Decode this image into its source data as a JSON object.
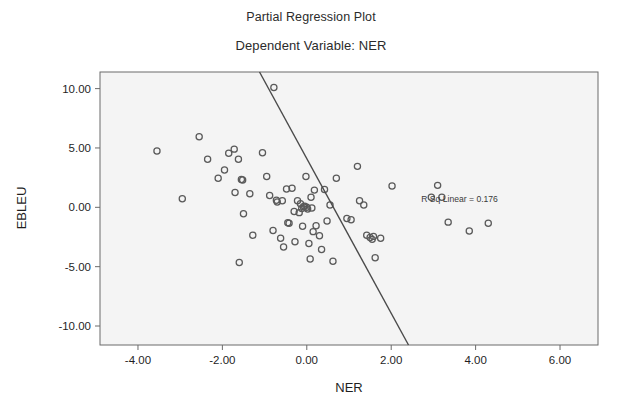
{
  "titles": {
    "main": "Partial Regression Plot",
    "sub": "Dependent Variable: NER"
  },
  "annotation": {
    "r_sq_label": "R Sq Linear = 0.176"
  },
  "axis_labels": {
    "x": "NER",
    "y": "EBLEU"
  },
  "ticks": {
    "x": [
      "-4.00",
      "-2.00",
      "0.00",
      "2.00",
      "4.00",
      "6.00"
    ],
    "y": [
      "10.00",
      "5.00",
      "0.00",
      "-5.00",
      "-10.00"
    ]
  },
  "colors": {
    "plot_background": "#f4f4f4",
    "frame": "#6b6b6b",
    "marker": "#5a5a5a",
    "fit_line": "#4a4a4a",
    "text": "#1f1f1f",
    "page_background": "#ffffff"
  },
  "chart_data": {
    "type": "scatter",
    "title": "Partial Regression Plot",
    "subtitle": "Dependent Variable: NER",
    "xlabel": "NER",
    "ylabel": "EBLEU",
    "xlim": [
      -4.9,
      6.9
    ],
    "ylim": [
      -11.6,
      11.4
    ],
    "xticks": [
      -4,
      -2,
      0,
      2,
      4,
      6
    ],
    "yticks": [
      10,
      5,
      0,
      -5,
      -10
    ],
    "grid": false,
    "legend": false,
    "annotations": [
      {
        "text": "R Sq Linear = 0.176",
        "x": 3.62,
        "y": 0.42
      }
    ],
    "r_squared": 0.176,
    "marker_style": "open-circle",
    "series": [
      {
        "name": "observations",
        "points": [
          [
            -3.55,
            4.75
          ],
          [
            -2.95,
            0.72
          ],
          [
            -2.55,
            5.95
          ],
          [
            -2.35,
            4.05
          ],
          [
            -2.1,
            2.45
          ],
          [
            -1.95,
            3.15
          ],
          [
            -1.85,
            4.55
          ],
          [
            -1.72,
            4.9
          ],
          [
            -1.7,
            1.25
          ],
          [
            -1.62,
            4.05
          ],
          [
            -1.6,
            -4.65
          ],
          [
            -1.55,
            2.35
          ],
          [
            -1.52,
            2.3
          ],
          [
            -1.5,
            -0.55
          ],
          [
            -1.35,
            1.15
          ],
          [
            -1.28,
            -2.35
          ],
          [
            -1.05,
            4.6
          ],
          [
            -0.95,
            2.6
          ],
          [
            -0.88,
            1.0
          ],
          [
            -0.8,
            -1.95
          ],
          [
            -0.78,
            10.1
          ],
          [
            -0.72,
            0.6
          ],
          [
            -0.7,
            0.45
          ],
          [
            -0.62,
            -2.6
          ],
          [
            -0.58,
            0.55
          ],
          [
            -0.55,
            -3.35
          ],
          [
            -0.48,
            1.55
          ],
          [
            -0.45,
            -1.3
          ],
          [
            -0.42,
            -1.35
          ],
          [
            -0.35,
            1.6
          ],
          [
            -0.3,
            -0.35
          ],
          [
            -0.28,
            -2.9
          ],
          [
            -0.22,
            0.55
          ],
          [
            -0.18,
            -0.45
          ],
          [
            -0.15,
            0.3
          ],
          [
            -0.12,
            -0.1
          ],
          [
            -0.1,
            -1.6
          ],
          [
            -0.08,
            0.05
          ],
          [
            -0.05,
            0.1
          ],
          [
            -0.02,
            2.6
          ],
          [
            0.0,
            0.0
          ],
          [
            0.02,
            -0.15
          ],
          [
            0.05,
            -3.05
          ],
          [
            0.08,
            -4.35
          ],
          [
            0.1,
            0.85
          ],
          [
            0.12,
            -0.05
          ],
          [
            0.15,
            -2.05
          ],
          [
            0.18,
            1.45
          ],
          [
            0.22,
            -1.55
          ],
          [
            0.3,
            -2.4
          ],
          [
            0.35,
            -3.55
          ],
          [
            0.42,
            1.5
          ],
          [
            0.48,
            -1.15
          ],
          [
            0.55,
            0.2
          ],
          [
            0.62,
            -4.55
          ],
          [
            0.7,
            2.45
          ],
          [
            0.95,
            -0.95
          ],
          [
            1.05,
            -1.05
          ],
          [
            1.2,
            3.45
          ],
          [
            1.25,
            0.55
          ],
          [
            1.35,
            0.2
          ],
          [
            1.42,
            -2.35
          ],
          [
            1.5,
            -2.55
          ],
          [
            1.55,
            -2.7
          ],
          [
            1.58,
            -2.45
          ],
          [
            1.62,
            -4.25
          ],
          [
            1.75,
            -2.6
          ],
          [
            2.02,
            1.8
          ],
          [
            2.95,
            0.85
          ],
          [
            3.1,
            1.85
          ],
          [
            3.2,
            0.85
          ],
          [
            3.35,
            -1.25
          ],
          [
            3.85,
            -2.0
          ],
          [
            4.3,
            -1.35
          ]
        ]
      }
    ],
    "fit_line": {
      "type": "linear",
      "x_endpoints": [
        -1.12,
        2.41
      ],
      "y_endpoints": [
        11.4,
        -11.6
      ]
    }
  }
}
